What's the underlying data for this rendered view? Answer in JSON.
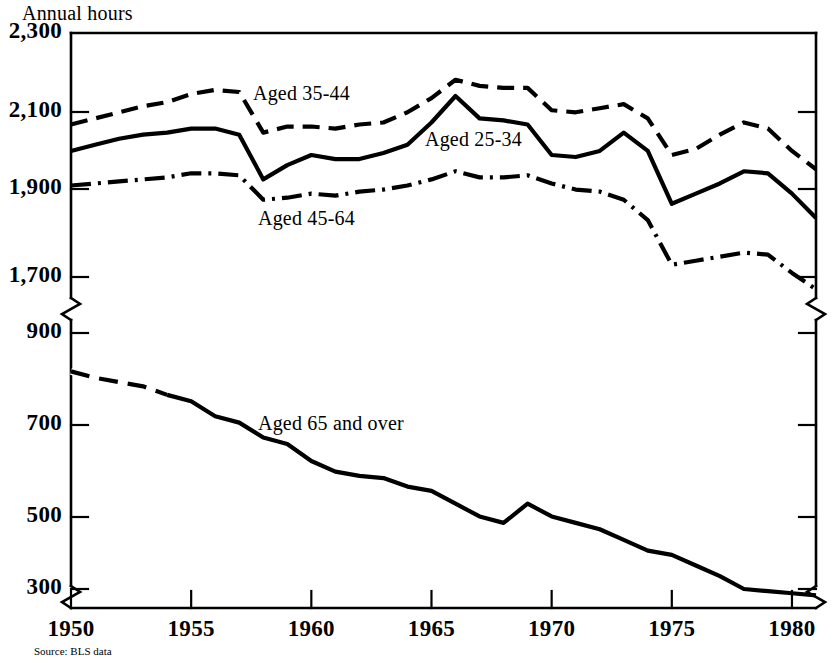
{
  "chart_data": {
    "type": "line",
    "title": "",
    "ylabel": "Annual hours",
    "xlabel": "",
    "source": "Source: BLS data",
    "grid": false,
    "legend_position": "inline-annotations",
    "xlim": [
      1950,
      1981
    ],
    "xticks": [
      "1950",
      "1955",
      "1960",
      "1965",
      "1970",
      "1975",
      "1980"
    ],
    "yticks_upper": [
      "2,300",
      "2,100",
      "1,900",
      "1,700"
    ],
    "yticks_lower": [
      "900",
      "700",
      "500",
      "300"
    ],
    "axis_break": true,
    "axis_break_note": "y-axis broken between 1,700 and 900",
    "ylim_upper": [
      1700,
      2300
    ],
    "ylim_lower": [
      250,
      900
    ],
    "x": [
      1950,
      1951,
      1952,
      1953,
      1954,
      1955,
      1956,
      1957,
      1958,
      1959,
      1960,
      1961,
      1962,
      1963,
      1964,
      1965,
      1966,
      1967,
      1968,
      1969,
      1970,
      1971,
      1972,
      1973,
      1974,
      1975,
      1976,
      1977,
      1978,
      1979,
      1980,
      1981
    ],
    "series": [
      {
        "name": "Aged 35-44",
        "label": "Aged 35-44",
        "style": "dashed",
        "values": [
          2075,
          2090,
          2105,
          2120,
          2130,
          2150,
          2160,
          2155,
          2055,
          2070,
          2070,
          2065,
          2075,
          2080,
          2105,
          2140,
          2185,
          2170,
          2165,
          2165,
          2110,
          2105,
          2115,
          2125,
          2090,
          2000,
          2015,
          2050,
          2080,
          2065,
          2010,
          1965
        ]
      },
      {
        "name": "Aged 25-34",
        "label": "Aged 25-34",
        "style": "solid",
        "values": [
          2010,
          2025,
          2040,
          2050,
          2055,
          2065,
          2065,
          2050,
          1940,
          1975,
          2000,
          1990,
          1990,
          2005,
          2025,
          2080,
          2145,
          2090,
          2085,
          2075,
          2000,
          1995,
          2010,
          2055,
          2010,
          1880,
          1905,
          1930,
          1960,
          1955,
          1905,
          1845
        ]
      },
      {
        "name": "Aged 45-64",
        "label": "Aged 45-64",
        "style": "dashdot",
        "values": [
          1925,
          1930,
          1935,
          1940,
          1945,
          1955,
          1955,
          1950,
          1890,
          1895,
          1905,
          1900,
          1910,
          1915,
          1925,
          1940,
          1960,
          1945,
          1945,
          1950,
          1930,
          1915,
          1910,
          1890,
          1840,
          1730,
          1740,
          1750,
          1760,
          1755,
          1710,
          1670
        ]
      },
      {
        "name": "Aged 65 and over",
        "label": "Aged 65 and over",
        "style": "solid-lower",
        "values": [
          810,
          795,
          785,
          775,
          755,
          740,
          705,
          690,
          655,
          640,
          600,
          575,
          565,
          560,
          540,
          530,
          500,
          470,
          455,
          500,
          470,
          455,
          440,
          415,
          390,
          380,
          355,
          330,
          300,
          295,
          290,
          285
        ]
      }
    ]
  }
}
